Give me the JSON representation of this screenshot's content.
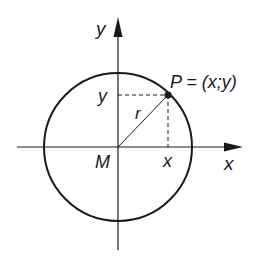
{
  "diagram": {
    "colors": {
      "stroke": "#1a1a1a",
      "background": "#ffffff"
    },
    "axes": {
      "x_label": "x",
      "y_label": "y",
      "origin_label": "M"
    },
    "circle": {
      "center_label": "M",
      "radius_label": "r"
    },
    "point": {
      "label": "P = (x;y)",
      "x_projection_label": "x",
      "y_projection_label": "y"
    }
  }
}
